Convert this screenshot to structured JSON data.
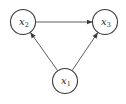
{
  "diagram": {
    "type": "directed-graph",
    "nodes": [
      {
        "id": "x1",
        "var": "x",
        "sub": "1",
        "cx": 65,
        "cy": 81,
        "r": 12.5
      },
      {
        "id": "x2",
        "var": "x",
        "sub": "2",
        "cx": 23,
        "cy": 22,
        "r": 12.5
      },
      {
        "id": "x3",
        "var": "x",
        "sub": "3",
        "cx": 105,
        "cy": 22,
        "r": 12.5
      }
    ],
    "edges": [
      {
        "from": "x2",
        "to": "x3"
      },
      {
        "from": "x1",
        "to": "x2"
      },
      {
        "from": "x1",
        "to": "x3"
      }
    ],
    "colors": {
      "stroke": "#3a3a3a",
      "edge": "#4a4a4a",
      "background": "#ffffff"
    }
  }
}
